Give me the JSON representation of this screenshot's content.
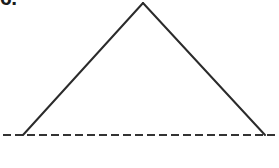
{
  "figure": {
    "item_label": "6.",
    "background_color": "#ffffff",
    "stroke_color": "#2b2b2b",
    "baseline_color": "#333333",
    "canvas": {
      "width": 279,
      "height": 168
    },
    "triangle": {
      "shape": "triangle",
      "fill": "none",
      "stroke_width": 2,
      "vertices": {
        "apex": {
          "x": 143,
          "y": 3
        },
        "base_left": {
          "x": 23,
          "y": 135
        },
        "base_right": {
          "x": 265,
          "y": 135
        }
      },
      "sides": [
        {
          "name": "left-leg",
          "from": "base_left",
          "to": "apex",
          "style": "solid"
        },
        {
          "name": "right-leg",
          "from": "apex",
          "to": "base_right",
          "style": "solid"
        },
        {
          "name": "base",
          "from": "base_left",
          "to": "base_right",
          "style": "dashed"
        }
      ]
    },
    "baseline": {
      "name": "dashed-baseline",
      "y": 135,
      "x_start": 3,
      "x_end": 279,
      "stroke_width": 2,
      "dash_length": 8,
      "gap_length": 4,
      "style": "dashed"
    }
  }
}
